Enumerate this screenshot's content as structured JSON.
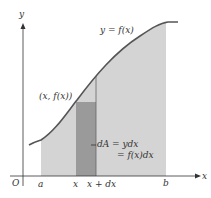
{
  "figure": {
    "type": "area-under-curve diagram",
    "colors": {
      "background": "#ffffff",
      "region_fill": "#d4d4d4",
      "strip_fill": "#9a9a9a",
      "curve": "#555555",
      "axis": "#333333",
      "text": "#333333"
    },
    "axes": {
      "x_label": "x",
      "y_label": "y",
      "origin_label": "O"
    },
    "curve_label": "y = f(x)",
    "point_label": "(x, f(x))",
    "tick_labels": {
      "a": "a",
      "x": "x",
      "x_plus_dx": "x + dx",
      "b": "b"
    },
    "annotation": {
      "line1": "dA = ydx",
      "line2": "= f(x)dx"
    }
  }
}
